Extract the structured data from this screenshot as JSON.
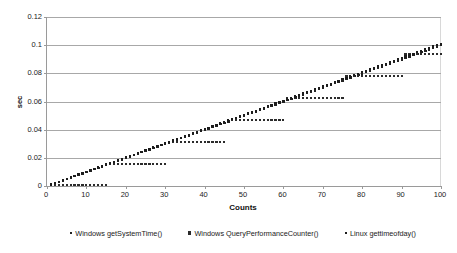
{
  "chart_data": {
    "type": "scatter",
    "title": "",
    "xlabel": "Counts",
    "ylabel": "sec",
    "xlim": [
      0,
      100
    ],
    "ylim": [
      0,
      0.12
    ],
    "xticks": [
      0,
      10,
      20,
      30,
      40,
      50,
      60,
      70,
      80,
      90,
      100
    ],
    "xtick_labels": [
      "0",
      "10",
      "20",
      "30",
      "40",
      "50",
      "60",
      "70",
      "80",
      "90",
      "100"
    ],
    "yticks": [
      0,
      0.02,
      0.04,
      0.06,
      0.08,
      0.1,
      0.12
    ],
    "ytick_labels": [
      "0",
      "0.02",
      "0.04",
      "0.06",
      "0.08",
      "0.1",
      "0.12"
    ],
    "grid": true,
    "grid_axis": "y",
    "legend_position": "bottom",
    "series": [
      {
        "name": "Windows getSystemTime()",
        "marker": "small-square",
        "color": "#222222",
        "x": [
          1,
          2,
          3,
          4,
          5,
          6,
          7,
          8,
          9,
          10,
          11,
          12,
          13,
          14,
          15,
          16,
          17,
          18,
          19,
          20,
          21,
          22,
          23,
          24,
          25,
          26,
          27,
          28,
          29,
          30,
          31,
          32,
          33,
          34,
          35,
          36,
          37,
          38,
          39,
          40,
          41,
          42,
          43,
          44,
          45,
          46,
          47,
          48,
          49,
          50,
          51,
          52,
          53,
          54,
          55,
          56,
          57,
          58,
          59,
          60,
          61,
          62,
          63,
          64,
          65,
          66,
          67,
          68,
          69,
          70,
          71,
          72,
          73,
          74,
          75,
          76,
          77,
          78,
          79,
          80,
          81,
          82,
          83,
          84,
          85,
          86,
          87,
          88,
          89,
          90,
          91,
          92,
          93,
          94,
          95,
          96,
          97,
          98,
          99,
          100
        ],
        "values": [
          0.001,
          0.002,
          0.003,
          0.004,
          0.005,
          0.006,
          0.007,
          0.008,
          0.009,
          0.01,
          0.011,
          0.012,
          0.013,
          0.014,
          0.015,
          0.016,
          0.017,
          0.018,
          0.019,
          0.02,
          0.021,
          0.022,
          0.023,
          0.024,
          0.025,
          0.026,
          0.027,
          0.028,
          0.029,
          0.03,
          0.031,
          0.032,
          0.033,
          0.034,
          0.035,
          0.036,
          0.037,
          0.038,
          0.039,
          0.04,
          0.041,
          0.042,
          0.043,
          0.044,
          0.045,
          0.046,
          0.047,
          0.048,
          0.049,
          0.05,
          0.051,
          0.052,
          0.053,
          0.054,
          0.055,
          0.056,
          0.057,
          0.058,
          0.059,
          0.06,
          0.061,
          0.062,
          0.063,
          0.064,
          0.065,
          0.066,
          0.067,
          0.068,
          0.069,
          0.07,
          0.071,
          0.072,
          0.073,
          0.074,
          0.075,
          0.076,
          0.077,
          0.078,
          0.079,
          0.08,
          0.081,
          0.082,
          0.083,
          0.084,
          0.085,
          0.086,
          0.087,
          0.088,
          0.089,
          0.09,
          0.091,
          0.092,
          0.093,
          0.094,
          0.095,
          0.096,
          0.097,
          0.098,
          0.099,
          0.1
        ]
      },
      {
        "name": "Windows QueryPerformanceCounter()",
        "marker": "square",
        "color": "#2b2b2b",
        "note": "quantized to ~15.6 ms timer granularity (staircase)",
        "x": [
          1,
          2,
          3,
          4,
          5,
          6,
          7,
          8,
          9,
          10,
          11,
          12,
          13,
          14,
          15,
          16,
          17,
          18,
          19,
          20,
          21,
          22,
          23,
          24,
          25,
          26,
          27,
          28,
          29,
          30,
          31,
          32,
          33,
          34,
          35,
          36,
          37,
          38,
          39,
          40,
          41,
          42,
          43,
          44,
          45,
          46,
          47,
          48,
          49,
          50,
          51,
          52,
          53,
          54,
          55,
          56,
          57,
          58,
          59,
          60,
          61,
          62,
          63,
          64,
          65,
          66,
          67,
          68,
          69,
          70,
          71,
          72,
          73,
          74,
          75,
          76,
          77,
          78,
          79,
          80,
          81,
          82,
          83,
          84,
          85,
          86,
          87,
          88,
          89,
          90,
          91,
          92,
          93,
          94,
          95,
          96,
          97,
          98,
          99,
          100
        ],
        "values": [
          0.0005,
          0.0005,
          0.0005,
          0.0005,
          0.0005,
          0.0005,
          0.0005,
          0.0005,
          0.0005,
          0.0005,
          0.0005,
          0.0005,
          0.0005,
          0.0005,
          0.0005,
          0.0156,
          0.0156,
          0.0156,
          0.0156,
          0.0156,
          0.0156,
          0.0156,
          0.0156,
          0.0156,
          0.0156,
          0.0156,
          0.0156,
          0.0156,
          0.0156,
          0.0156,
          0.0312,
          0.0312,
          0.0312,
          0.0312,
          0.0312,
          0.0312,
          0.0312,
          0.0312,
          0.0312,
          0.0312,
          0.0312,
          0.0312,
          0.0312,
          0.0312,
          0.0312,
          0.0468,
          0.0468,
          0.0468,
          0.0468,
          0.0468,
          0.0468,
          0.0468,
          0.0468,
          0.0468,
          0.0468,
          0.0468,
          0.0468,
          0.0468,
          0.0468,
          0.0468,
          0.0625,
          0.0625,
          0.0625,
          0.0625,
          0.0625,
          0.0625,
          0.0625,
          0.0625,
          0.0625,
          0.0625,
          0.0625,
          0.0625,
          0.0625,
          0.0625,
          0.0625,
          0.0781,
          0.0781,
          0.0781,
          0.0781,
          0.0781,
          0.0781,
          0.0781,
          0.0781,
          0.0781,
          0.0781,
          0.0781,
          0.0781,
          0.0781,
          0.0781,
          0.0781,
          0.0937,
          0.0937,
          0.0937,
          0.0937,
          0.0937,
          0.0937,
          0.0937,
          0.0937,
          0.0937,
          0.0937
        ]
      },
      {
        "name": "Linux gettimeofday()",
        "marker": "small-square",
        "color": "#1c1c1c",
        "x": [
          1,
          2,
          3,
          4,
          5,
          6,
          7,
          8,
          9,
          10,
          11,
          12,
          13,
          14,
          15,
          16,
          17,
          18,
          19,
          20,
          21,
          22,
          23,
          24,
          25,
          26,
          27,
          28,
          29,
          30,
          31,
          32,
          33,
          34,
          35,
          36,
          37,
          38,
          39,
          40,
          41,
          42,
          43,
          44,
          45,
          46,
          47,
          48,
          49,
          50,
          51,
          52,
          53,
          54,
          55,
          56,
          57,
          58,
          59,
          60,
          61,
          62,
          63,
          64,
          65,
          66,
          67,
          68,
          69,
          70,
          71,
          72,
          73,
          74,
          75,
          76,
          77,
          78,
          79,
          80,
          81,
          82,
          83,
          84,
          85,
          86,
          87,
          88,
          89,
          90,
          91,
          92,
          93,
          94,
          95,
          96,
          97,
          98,
          99,
          100
        ],
        "values": [
          0.001,
          0.0021,
          0.0031,
          0.0041,
          0.0051,
          0.0061,
          0.0071,
          0.0081,
          0.0091,
          0.0101,
          0.0111,
          0.0121,
          0.0131,
          0.0141,
          0.0152,
          0.0162,
          0.0172,
          0.0182,
          0.0192,
          0.0202,
          0.0212,
          0.0222,
          0.0232,
          0.0242,
          0.0253,
          0.0263,
          0.0273,
          0.0283,
          0.0293,
          0.0303,
          0.0313,
          0.0323,
          0.0333,
          0.0343,
          0.0354,
          0.0364,
          0.0374,
          0.0384,
          0.0394,
          0.0404,
          0.0414,
          0.0424,
          0.0434,
          0.0444,
          0.0455,
          0.0465,
          0.0475,
          0.0485,
          0.0495,
          0.0505,
          0.0515,
          0.0525,
          0.0535,
          0.0545,
          0.0556,
          0.0566,
          0.0576,
          0.0586,
          0.0596,
          0.0606,
          0.0616,
          0.0626,
          0.0636,
          0.0646,
          0.0657,
          0.0667,
          0.0677,
          0.0687,
          0.0697,
          0.0707,
          0.0717,
          0.0727,
          0.0737,
          0.0747,
          0.0758,
          0.0768,
          0.0778,
          0.0788,
          0.0798,
          0.0808,
          0.0818,
          0.0828,
          0.0838,
          0.0848,
          0.0859,
          0.0869,
          0.0879,
          0.0889,
          0.0899,
          0.0909,
          0.0919,
          0.0929,
          0.0939,
          0.0949,
          0.096,
          0.097,
          0.098,
          0.099,
          0.1,
          0.101
        ]
      }
    ]
  },
  "colors": {
    "series1": "#222222",
    "series2": "#2b2b2b",
    "series3": "#1c1c1c",
    "gridline": "#a8a8a8",
    "axis": "#9a9a9a",
    "background": "#ffffff"
  }
}
